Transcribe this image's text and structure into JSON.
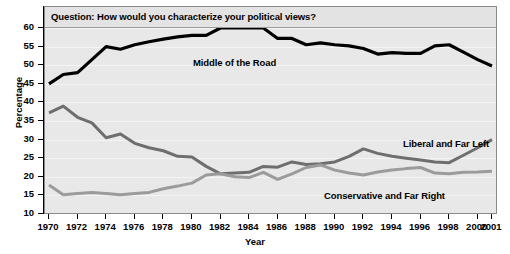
{
  "chart_data": {
    "type": "line",
    "title": "Question: How would you characterize your political views?",
    "xlabel": "Year",
    "ylabel": "Percentage",
    "ylim": [
      10,
      60
    ],
    "xlim": [
      1970,
      2001
    ],
    "grid": true,
    "legend_position": "inline-annotations",
    "ytick_labels": [
      "60",
      "55",
      "50",
      "45",
      "40",
      "35",
      "30",
      "25",
      "20",
      "15",
      "10"
    ],
    "ytick_values": [
      60,
      55,
      50,
      45,
      40,
      35,
      30,
      25,
      20,
      15,
      10
    ],
    "xtick_labels": [
      "1970",
      "1972",
      "1974",
      "1976",
      "1978",
      "1980",
      "1982",
      "1984",
      "1986",
      "1988",
      "1990",
      "1992",
      "1994",
      "1996",
      "1998",
      "2000",
      "2001"
    ],
    "xtick_values": [
      1970,
      1972,
      1974,
      1976,
      1978,
      1980,
      1982,
      1984,
      1986,
      1988,
      1990,
      1992,
      1994,
      1996,
      1998,
      2000,
      2001
    ],
    "x": [
      1970,
      1971,
      1972,
      1973,
      1974,
      1975,
      1976,
      1977,
      1978,
      1979,
      1980,
      1981,
      1982,
      1983,
      1984,
      1985,
      1986,
      1987,
      1988,
      1989,
      1990,
      1991,
      1992,
      1993,
      1994,
      1995,
      1996,
      1997,
      1998,
      1999,
      2000,
      2001
    ],
    "series": [
      {
        "name": "Middle of the Road",
        "color": "#000000",
        "width": 3.2,
        "values": [
          45.0,
          47.5,
          48.0,
          51.5,
          55.0,
          54.3,
          55.5,
          56.3,
          57.0,
          57.6,
          58.0,
          58.0,
          60.0,
          60.0,
          60.0,
          60.0,
          57.2,
          57.2,
          55.5,
          56.0,
          55.5,
          55.2,
          54.5,
          53.0,
          53.4,
          53.2,
          53.2,
          55.2,
          55.5,
          53.5,
          51.5,
          49.8
        ]
      },
      {
        "name": "Liberal and Far Left",
        "color": "#6e6e6e",
        "width": 3.0,
        "values": [
          37.2,
          39.0,
          36.0,
          34.5,
          30.5,
          31.5,
          29.0,
          27.8,
          27.0,
          25.5,
          25.3,
          22.8,
          20.8,
          21.0,
          21.2,
          22.8,
          22.6,
          24.0,
          23.3,
          23.5,
          24.0,
          25.5,
          27.5,
          26.3,
          25.5,
          25.0,
          24.5,
          24.0,
          23.8,
          25.8,
          27.8,
          30.0
        ]
      },
      {
        "name": "Conservative and Far Right",
        "color": "#9b9b9b",
        "width": 3.0,
        "values": [
          17.8,
          15.2,
          15.5,
          15.8,
          15.5,
          15.2,
          15.5,
          15.8,
          16.8,
          17.5,
          18.3,
          20.5,
          20.8,
          20.0,
          19.8,
          21.2,
          19.3,
          20.8,
          22.5,
          23.2,
          21.8,
          21.0,
          20.5,
          21.3,
          21.8,
          22.2,
          22.5,
          21.0,
          20.8,
          21.2,
          21.3,
          21.5
        ]
      }
    ]
  },
  "annotations": {
    "middle": "Middle of the Road",
    "liberal": "Liberal and Far Left",
    "conservative": "Conservative and Far Right"
  }
}
